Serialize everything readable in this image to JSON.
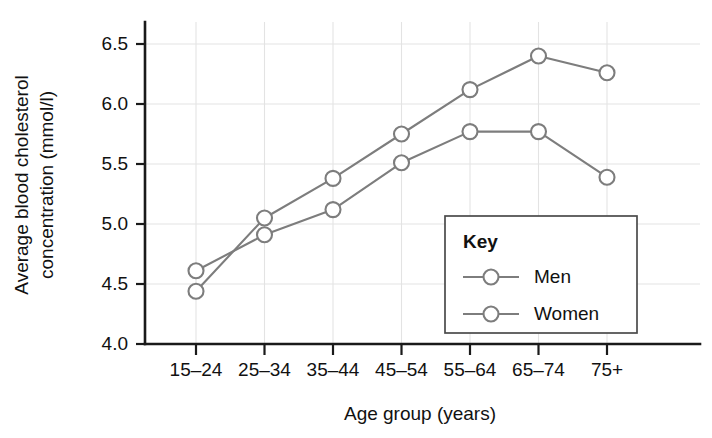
{
  "chart_data": {
    "type": "line",
    "title": "",
    "xlabel": "Age group (years)",
    "ylabel": "Average blood cholesterol concentration (mmol/l)",
    "ylabel_lines": [
      "Average blood cholesterol",
      "concentration (mmol/l)"
    ],
    "categories": [
      "15–24",
      "25–34",
      "35–44",
      "45–54",
      "55–64",
      "65–74",
      "75+"
    ],
    "series": [
      {
        "name": "Men",
        "values": [
          4.44,
          5.05,
          5.38,
          5.75,
          6.12,
          6.4,
          6.26
        ],
        "color": "#7d7d7d"
      },
      {
        "name": "Women",
        "values": [
          4.61,
          4.91,
          5.12,
          5.51,
          5.77,
          5.77,
          5.39
        ],
        "color": "#7d7d7d"
      }
    ],
    "ylim": [
      4.0,
      6.65
    ],
    "yticks": [
      4.0,
      4.5,
      5.0,
      5.5,
      6.0,
      6.5
    ],
    "ytick_labels": [
      "4.0",
      "4.5",
      "5.0",
      "5.5",
      "6.0",
      "6.5"
    ],
    "grid": true,
    "legend_position": "inside-lower-right",
    "legend_title": "Key",
    "marker": "open-circle"
  },
  "legend": {
    "title": "Key",
    "entries": [
      "Men",
      "Women"
    ]
  },
  "axes": {
    "y_title_line1": "Average blood cholesterol",
    "y_title_line2": "concentration (mmol/l)",
    "x_title": "Age group (years)"
  }
}
